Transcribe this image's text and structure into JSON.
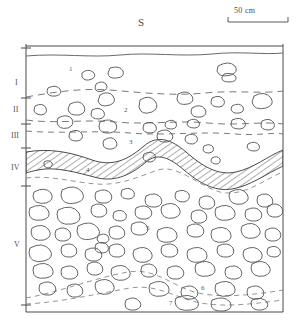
{
  "figure": {
    "kind": "archaeological-section-drawing",
    "direction_marker": "S",
    "scale_bar": {
      "label": "50 cm",
      "x_start": 228,
      "x_end": 288,
      "y": 22
    },
    "frame": {
      "left": 26,
      "right": 283,
      "top": 44,
      "bottom": 312
    },
    "colors": {
      "ink": "#4a4a4a",
      "stone": "#5d5d5d",
      "dashed": "#6b6b6b",
      "hatch": "#4a4a4a"
    }
  },
  "axis": {
    "name": "stratigraphic-unit-axis",
    "x": 26,
    "units": [
      {
        "label": "I",
        "y": 84
      },
      {
        "label": "II",
        "y": 111
      },
      {
        "label": "III",
        "y": 137
      },
      {
        "label": "IV",
        "y": 169
      },
      {
        "label": "V",
        "y": 246
      }
    ],
    "ticks": [
      {
        "y": 48
      },
      {
        "y": 98
      },
      {
        "y": 124
      },
      {
        "y": 148
      },
      {
        "y": 186
      },
      {
        "y": 305
      }
    ]
  },
  "layers": [
    {
      "number": "1",
      "x": 69,
      "y": 70
    },
    {
      "number": "2",
      "x": 124,
      "y": 111
    },
    {
      "number": "3",
      "x": 129,
      "y": 143
    },
    {
      "number": "4",
      "x": 86,
      "y": 171
    },
    {
      "number": "5",
      "x": 146,
      "y": 229
    },
    {
      "number": "6",
      "x": 201,
      "y": 289
    },
    {
      "number": "7",
      "x": 169,
      "y": 304
    }
  ]
}
